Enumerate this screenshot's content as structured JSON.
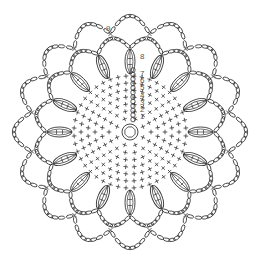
{
  "diagram": {
    "center": [
      130,
      132
    ],
    "stroke_color": "#333333",
    "label_color": "#555555",
    "background": "#ffffff",
    "magic_ring": {
      "radius": 8,
      "inner_radius": 5.5
    },
    "sc_rows": {
      "count": 7,
      "radii": [
        14,
        21,
        28,
        35,
        42,
        49,
        56
      ],
      "stitches_per_row": [
        8,
        14,
        20,
        26,
        32,
        38,
        44
      ]
    },
    "start_chain_column": {
      "x": 133,
      "y_top": 70,
      "y_bottom": 120
    },
    "shells": {
      "count": 16,
      "inner_radius": 58,
      "outer_radius": 83,
      "round": 8
    },
    "middle_loops": {
      "count": 16,
      "radius": 88,
      "bulge": 12,
      "round": 8
    },
    "outer_loops": {
      "count": 16,
      "radius": 100,
      "bulge": 17,
      "round": 9
    },
    "row_labels": [
      {
        "text": "1",
        "x": 140,
        "y": 119
      },
      {
        "text": "2",
        "x": 140,
        "y": 112
      },
      {
        "text": "3",
        "x": 140,
        "y": 105
      },
      {
        "text": "4",
        "x": 140,
        "y": 98
      },
      {
        "text": "5",
        "x": 140,
        "y": 90
      },
      {
        "text": "6",
        "x": 140,
        "y": 83
      },
      {
        "text": "7",
        "x": 140,
        "y": 76
      },
      {
        "text": "8",
        "x": 140,
        "y": 59
      },
      {
        "text": "9",
        "x": 106,
        "y": 31
      }
    ]
  }
}
